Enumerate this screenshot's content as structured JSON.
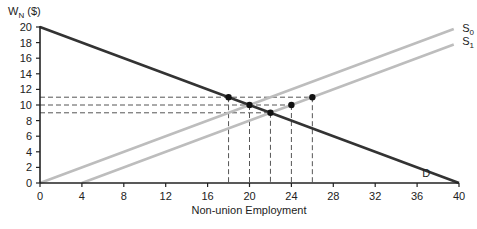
{
  "chart_data": {
    "type": "line",
    "title": "",
    "xlabel": "Non-union Employment",
    "ylabel": "W_N ($)",
    "ylabel_main": "W",
    "ylabel_sub": "N",
    "ylabel_suffix": " ($)",
    "xlim": [
      0,
      40
    ],
    "ylim": [
      0,
      20
    ],
    "x_ticks": [
      0,
      4,
      8,
      12,
      16,
      20,
      24,
      28,
      32,
      36,
      40
    ],
    "y_ticks": [
      0,
      2,
      4,
      6,
      8,
      10,
      12,
      14,
      16,
      18,
      20
    ],
    "grid": false,
    "series": [
      {
        "name": "D",
        "label_main": "D",
        "label_sub": "",
        "points": [
          [
            0,
            20
          ],
          [
            40,
            0
          ]
        ],
        "color": "#333333",
        "label_at": [
          36.5,
          1.3
        ]
      },
      {
        "name": "S0",
        "label_main": "S",
        "label_sub": "0",
        "points": [
          [
            0,
            0
          ],
          [
            39.5,
            19.75
          ]
        ],
        "color": "#bdbdbd",
        "label_at": [
          40.3,
          19.9
        ]
      },
      {
        "name": "S1",
        "label_main": "S",
        "label_sub": "1",
        "points": [
          [
            4,
            0
          ],
          [
            39.5,
            17.75
          ]
        ],
        "color": "#bdbdbd",
        "label_at": [
          40.3,
          18.2
        ]
      }
    ],
    "points": [
      {
        "x": 18,
        "y": 11
      },
      {
        "x": 20,
        "y": 10
      },
      {
        "x": 22,
        "y": 9
      },
      {
        "x": 24,
        "y": 10
      },
      {
        "x": 26,
        "y": 11
      }
    ],
    "h_guides": [
      {
        "y": 11,
        "x_end": 26
      },
      {
        "y": 10,
        "x_end": 24
      },
      {
        "y": 9,
        "x_end": 22
      }
    ],
    "v_guides": [
      {
        "x": 18,
        "y_top": 11
      },
      {
        "x": 20,
        "y_top": 10
      },
      {
        "x": 22,
        "y_top": 9
      },
      {
        "x": 24,
        "y_top": 10
      },
      {
        "x": 26,
        "y_top": 11
      }
    ],
    "colors": {
      "axis": "#222222",
      "guide": "#555555",
      "point": "#111111"
    }
  }
}
